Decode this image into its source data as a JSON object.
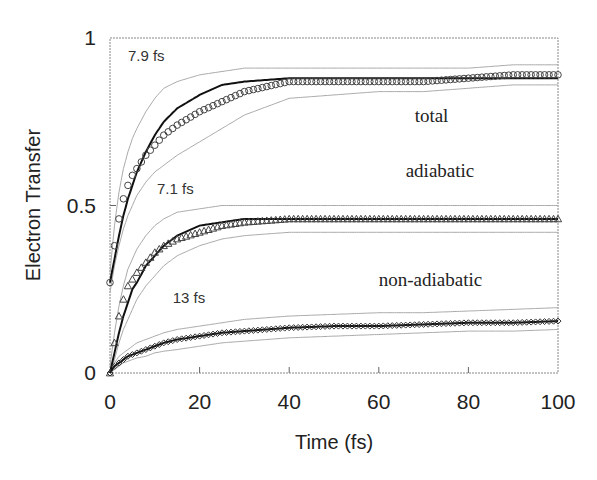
{
  "chart_data": {
    "type": "line",
    "title": "",
    "xlabel": "Time (fs)",
    "ylabel": "Electron Transfer",
    "xlim": [
      0,
      100
    ],
    "ylim": [
      0,
      1
    ],
    "xticks": [
      0,
      20,
      40,
      60,
      80,
      100
    ],
    "yticks": [
      0,
      0.5,
      1
    ],
    "ytick_labels": [
      "0",
      "0.5",
      "1"
    ],
    "grid": false,
    "legend": "none (inline text labels)",
    "series": [
      {
        "name": "total",
        "marker": "circle",
        "fit_time_constant_label": "7.9 fs",
        "x": [
          0,
          1,
          2,
          3,
          4,
          5,
          6,
          8,
          10,
          12,
          15,
          20,
          25,
          30,
          40,
          50,
          60,
          70,
          80,
          90,
          100
        ],
        "values": [
          0.27,
          0.38,
          0.46,
          0.52,
          0.56,
          0.59,
          0.61,
          0.65,
          0.68,
          0.71,
          0.74,
          0.78,
          0.81,
          0.84,
          0.87,
          0.87,
          0.87,
          0.87,
          0.88,
          0.89,
          0.89
        ],
        "fit": [
          0.27,
          0.34,
          0.41,
          0.47,
          0.52,
          0.56,
          0.6,
          0.66,
          0.71,
          0.75,
          0.79,
          0.83,
          0.86,
          0.87,
          0.88,
          0.88,
          0.88,
          0.88,
          0.88,
          0.88,
          0.88
        ],
        "upper": [
          0.3,
          0.44,
          0.54,
          0.61,
          0.66,
          0.7,
          0.73,
          0.78,
          0.82,
          0.85,
          0.87,
          0.89,
          0.9,
          0.91,
          0.91,
          0.91,
          0.91,
          0.91,
          0.91,
          0.92,
          0.92
        ],
        "lower": [
          0.24,
          0.32,
          0.38,
          0.43,
          0.47,
          0.5,
          0.53,
          0.57,
          0.6,
          0.62,
          0.65,
          0.69,
          0.73,
          0.77,
          0.82,
          0.83,
          0.84,
          0.84,
          0.85,
          0.86,
          0.86
        ]
      },
      {
        "name": "adiabatic",
        "marker": "triangle",
        "fit_time_constant_label": "7.1 fs",
        "x": [
          0,
          1,
          2,
          3,
          4,
          5,
          6,
          8,
          10,
          12,
          15,
          20,
          25,
          30,
          40,
          50,
          60,
          70,
          80,
          90,
          100
        ],
        "values": [
          0,
          0.09,
          0.17,
          0.22,
          0.26,
          0.28,
          0.3,
          0.33,
          0.36,
          0.38,
          0.4,
          0.42,
          0.44,
          0.45,
          0.46,
          0.46,
          0.46,
          0.46,
          0.46,
          0.46,
          0.46
        ],
        "fit": [
          0,
          0.06,
          0.12,
          0.17,
          0.21,
          0.25,
          0.27,
          0.32,
          0.35,
          0.38,
          0.41,
          0.44,
          0.45,
          0.46,
          0.46,
          0.46,
          0.46,
          0.46,
          0.46,
          0.46,
          0.46
        ],
        "upper": [
          0.02,
          0.12,
          0.2,
          0.26,
          0.31,
          0.34,
          0.37,
          0.41,
          0.44,
          0.46,
          0.48,
          0.49,
          0.5,
          0.5,
          0.5,
          0.5,
          0.5,
          0.5,
          0.5,
          0.5,
          0.5
        ],
        "lower": [
          0,
          0.04,
          0.09,
          0.13,
          0.16,
          0.19,
          0.22,
          0.26,
          0.29,
          0.32,
          0.35,
          0.38,
          0.4,
          0.41,
          0.42,
          0.42,
          0.42,
          0.42,
          0.42,
          0.42,
          0.42
        ]
      },
      {
        "name": "non-adiabatic",
        "marker": "diamond",
        "fit_time_constant_label": "13 fs",
        "x": [
          0,
          1,
          2,
          3,
          4,
          5,
          6,
          8,
          10,
          12,
          15,
          20,
          25,
          30,
          40,
          50,
          60,
          70,
          80,
          90,
          100
        ],
        "values": [
          0,
          0.02,
          0.03,
          0.04,
          0.05,
          0.055,
          0.06,
          0.07,
          0.08,
          0.09,
          0.1,
          0.11,
          0.12,
          0.125,
          0.135,
          0.14,
          0.14,
          0.145,
          0.15,
          0.15,
          0.155
        ],
        "fit": [
          0,
          0.02,
          0.03,
          0.04,
          0.05,
          0.055,
          0.06,
          0.07,
          0.08,
          0.09,
          0.1,
          0.11,
          0.12,
          0.125,
          0.135,
          0.14,
          0.14,
          0.145,
          0.15,
          0.15,
          0.155
        ],
        "upper": [
          0,
          0.03,
          0.05,
          0.06,
          0.07,
          0.08,
          0.09,
          0.1,
          0.11,
          0.12,
          0.13,
          0.14,
          0.15,
          0.16,
          0.17,
          0.175,
          0.18,
          0.18,
          0.185,
          0.19,
          0.195
        ],
        "lower": [
          0,
          0.01,
          0.02,
          0.03,
          0.035,
          0.04,
          0.045,
          0.05,
          0.06,
          0.065,
          0.07,
          0.08,
          0.09,
          0.095,
          0.105,
          0.11,
          0.115,
          0.12,
          0.125,
          0.125,
          0.13
        ]
      }
    ],
    "annotations": [
      {
        "text": "7.9 fs",
        "x": 4,
        "y": 0.93
      },
      {
        "text": "7.1 fs",
        "x": 10.5,
        "y": 0.535
      },
      {
        "text": "13 fs",
        "x": 14,
        "y": 0.21
      },
      {
        "text": "total",
        "x": 68,
        "y": 0.75
      },
      {
        "text": "adiabatic",
        "x": 66,
        "y": 0.585
      },
      {
        "text": "non-adiabatic",
        "x": 60,
        "y": 0.26
      }
    ]
  },
  "plot": {
    "ylabel": "Electron Transfer",
    "xlabel": "Time (fs)"
  }
}
